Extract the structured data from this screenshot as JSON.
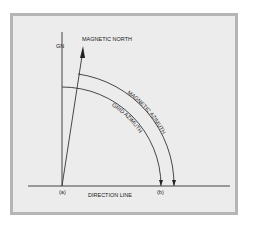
{
  "diagram": {
    "labels": {
      "grid_north": "GN",
      "magnetic_north": "MAGNETIC NORTH",
      "magnetic_azimuth": "MAGNETIC AZIMUTH",
      "grid_azimuth": "GRID AZIMUTH",
      "point_a": "(a)",
      "point_b": "(b)",
      "direction_line": "DIRECTION LINE"
    },
    "colors": {
      "frame_border": "#b5b5b5",
      "background": "#ececec",
      "line": "#333333"
    }
  }
}
